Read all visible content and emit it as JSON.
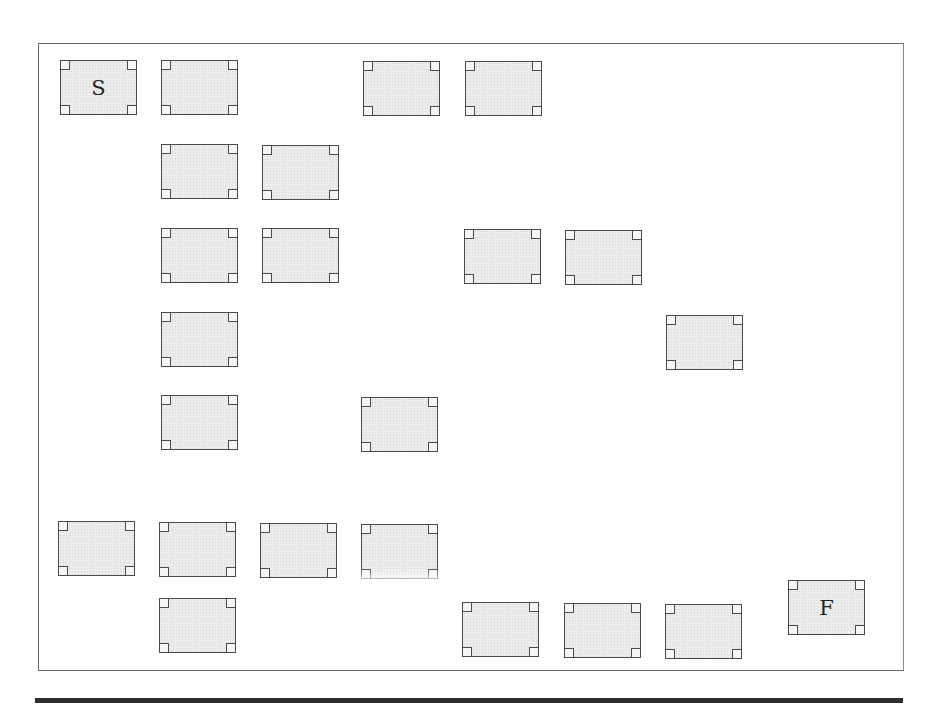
{
  "diagram": {
    "type": "grid-rooms",
    "start_label": "S",
    "finish_label": "F",
    "rooms": [
      {
        "id": "r1",
        "label": "S",
        "x": 60,
        "y": 60
      },
      {
        "id": "r2",
        "label": "",
        "x": 161,
        "y": 60
      },
      {
        "id": "r3",
        "label": "",
        "x": 363,
        "y": 61
      },
      {
        "id": "r4",
        "label": "",
        "x": 465,
        "y": 61
      },
      {
        "id": "r5",
        "label": "",
        "x": 161,
        "y": 144
      },
      {
        "id": "r6",
        "label": "",
        "x": 262,
        "y": 145
      },
      {
        "id": "r7",
        "label": "",
        "x": 161,
        "y": 228
      },
      {
        "id": "r8",
        "label": "",
        "x": 262,
        "y": 228
      },
      {
        "id": "r9",
        "label": "",
        "x": 464,
        "y": 229
      },
      {
        "id": "r10",
        "label": "",
        "x": 565,
        "y": 230
      },
      {
        "id": "r11",
        "label": "",
        "x": 161,
        "y": 312
      },
      {
        "id": "r12",
        "label": "",
        "x": 666,
        "y": 315
      },
      {
        "id": "r13",
        "label": "",
        "x": 161,
        "y": 395
      },
      {
        "id": "r14",
        "label": "",
        "x": 361,
        "y": 397
      },
      {
        "id": "r15",
        "label": "",
        "x": 58,
        "y": 521
      },
      {
        "id": "r16",
        "label": "",
        "x": 159,
        "y": 522
      },
      {
        "id": "r17",
        "label": "",
        "x": 260,
        "y": 523
      },
      {
        "id": "r18",
        "label": "",
        "x": 361,
        "y": 524
      },
      {
        "id": "r19",
        "label": "",
        "x": 159,
        "y": 598
      },
      {
        "id": "r20",
        "label": "",
        "x": 462,
        "y": 602
      },
      {
        "id": "r21",
        "label": "",
        "x": 564,
        "y": 603
      },
      {
        "id": "r22",
        "label": "",
        "x": 665,
        "y": 604
      },
      {
        "id": "r23",
        "label": "F",
        "x": 788,
        "y": 580
      }
    ]
  }
}
